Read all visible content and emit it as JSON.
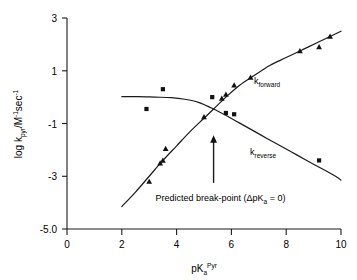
{
  "chart_data": {
    "type": "scatter",
    "title": "",
    "subtitle": "",
    "xlabel": "pKaPyr",
    "xlabel_parts": {
      "base": "pK",
      "sub": "a",
      "sup": "Pyr"
    },
    "ylabel": "log kpyr/M-1sec-1",
    "ylabel_parts": {
      "base": "log k",
      "sub": "pyr",
      "mid": "/M",
      "sup1": "-1",
      "unit": "sec",
      "sup2": "-1"
    },
    "xlim": [
      0,
      10
    ],
    "ylim": [
      -5.0,
      3.0
    ],
    "xticks": [
      0,
      2,
      4,
      6,
      8,
      10
    ],
    "xtick_labels": [
      "0",
      "2",
      "4",
      "6",
      "8",
      "10"
    ],
    "yticks": [
      3,
      1,
      -1,
      -3,
      -5.0
    ],
    "ytick_labels": [
      "3",
      "1",
      "-1",
      "-3",
      "-5.0"
    ],
    "grid": false,
    "legend_position": "inline-curve-labels",
    "series": [
      {
        "name": "k_forward",
        "label_base": "k",
        "label_sub": "forward",
        "marker": "triangle",
        "color": "#111111",
        "points": [
          {
            "x": 3.0,
            "y": -3.2
          },
          {
            "x": 3.4,
            "y": -2.5
          },
          {
            "x": 3.5,
            "y": -2.4
          },
          {
            "x": 3.6,
            "y": -1.95
          },
          {
            "x": 5.0,
            "y": -0.75
          },
          {
            "x": 5.65,
            "y": -0.05
          },
          {
            "x": 5.8,
            "y": 0.1
          },
          {
            "x": 6.1,
            "y": 0.45
          },
          {
            "x": 6.7,
            "y": 0.75
          },
          {
            "x": 8.5,
            "y": 1.75
          },
          {
            "x": 9.2,
            "y": 1.9
          },
          {
            "x": 9.6,
            "y": 2.3
          }
        ],
        "fit_points": [
          {
            "x": 2.0,
            "y": -4.15
          },
          {
            "x": 2.5,
            "y": -3.6
          },
          {
            "x": 3.0,
            "y": -3.0
          },
          {
            "x": 3.5,
            "y": -2.4
          },
          {
            "x": 4.0,
            "y": -1.85
          },
          {
            "x": 4.5,
            "y": -1.3
          },
          {
            "x": 5.0,
            "y": -0.8
          },
          {
            "x": 5.35,
            "y": -0.45
          },
          {
            "x": 5.8,
            "y": 0.0
          },
          {
            "x": 6.3,
            "y": 0.45
          },
          {
            "x": 6.8,
            "y": 0.8
          },
          {
            "x": 7.4,
            "y": 1.2
          },
          {
            "x": 8.0,
            "y": 1.5
          },
          {
            "x": 8.6,
            "y": 1.8
          },
          {
            "x": 9.2,
            "y": 2.1
          },
          {
            "x": 10.0,
            "y": 2.5
          }
        ]
      },
      {
        "name": "k_reverse",
        "label_base": "k",
        "label_sub": "reverse",
        "marker": "square",
        "color": "#111111",
        "points": [
          {
            "x": 2.9,
            "y": -0.45
          },
          {
            "x": 3.5,
            "y": 0.3
          },
          {
            "x": 5.3,
            "y": 0.0
          },
          {
            "x": 5.8,
            "y": -0.6
          },
          {
            "x": 6.1,
            "y": -0.65
          },
          {
            "x": 9.2,
            "y": -2.4
          }
        ],
        "fit_points": [
          {
            "x": 2.0,
            "y": 0.02
          },
          {
            "x": 2.6,
            "y": 0.02
          },
          {
            "x": 3.2,
            "y": 0.0
          },
          {
            "x": 3.8,
            "y": -0.02
          },
          {
            "x": 4.3,
            "y": -0.08
          },
          {
            "x": 4.8,
            "y": -0.2
          },
          {
            "x": 5.35,
            "y": -0.45
          },
          {
            "x": 5.9,
            "y": -0.75
          },
          {
            "x": 6.5,
            "y": -1.1
          },
          {
            "x": 7.1,
            "y": -1.45
          },
          {
            "x": 7.7,
            "y": -1.8
          },
          {
            "x": 8.4,
            "y": -2.2
          },
          {
            "x": 9.1,
            "y": -2.6
          },
          {
            "x": 9.8,
            "y": -3.0
          },
          {
            "x": 10.0,
            "y": -3.15
          }
        ]
      }
    ],
    "annotations": [
      {
        "name": "break-point-arrow",
        "type": "arrow",
        "x": 5.35,
        "y_tail": -3.25,
        "y_head": -1.45
      },
      {
        "name": "break-point-text",
        "type": "text",
        "text": "Predicted break-point (ΔpKa = 0)",
        "text_parts": {
          "prefix": "Predicted break-point (",
          "delta": "Δ",
          "pk": "pK",
          "sub": "a",
          "suffix": " = 0)"
        },
        "x": 5.6,
        "y": -3.95
      }
    ]
  }
}
